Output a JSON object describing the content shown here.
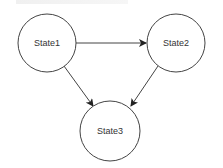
{
  "diagram": {
    "type": "state-diagram",
    "nodes": [
      {
        "id": "s1",
        "label": "State1",
        "cx": 47,
        "cy": 43,
        "r": 29
      },
      {
        "id": "s2",
        "label": "State2",
        "cx": 176,
        "cy": 43,
        "r": 29
      },
      {
        "id": "s3",
        "label": "State3",
        "cx": 110,
        "cy": 131,
        "r": 30
      }
    ],
    "edges": [
      {
        "from": "State1",
        "to": "State2"
      },
      {
        "from": "State1",
        "to": "State3"
      },
      {
        "from": "State2",
        "to": "State3"
      }
    ],
    "colors": {
      "stroke": "#333333",
      "fill": "#ffffff",
      "text": "#333333"
    }
  }
}
